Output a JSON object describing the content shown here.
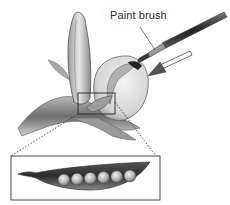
{
  "figure": {
    "labels": {
      "paint_brush": "Paint brush"
    },
    "inset": {
      "subject": "magnified pea pod",
      "pea_count": 6
    },
    "colors": {
      "ink": "#2a2a2a",
      "petal_light": "#e8e8e8",
      "petal_shade": "#8a8a8a",
      "pod_dark": "#3a3a3a",
      "pea": "#bdbdbd",
      "arrow": "#555555"
    }
  }
}
